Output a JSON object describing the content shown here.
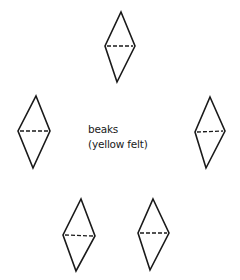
{
  "diagram": {
    "label": {
      "line1": "beaks",
      "line2": "(yellow felt)"
    },
    "stroke_color": "#1a1a1a",
    "background": "#ffffff",
    "shapes": [
      {
        "name": "beak-top",
        "top": [
          121,
          12
        ],
        "left": [
          105,
          46
        ],
        "right": [
          135,
          46
        ],
        "bottom": [
          117,
          82
        ]
      },
      {
        "name": "beak-left",
        "top": [
          36,
          96
        ],
        "left": [
          18,
          131
        ],
        "right": [
          50,
          131
        ],
        "bottom": [
          33,
          168
        ]
      },
      {
        "name": "beak-right",
        "top": [
          210,
          97
        ],
        "left": [
          195,
          132
        ],
        "right": [
          225,
          131
        ],
        "bottom": [
          206,
          168
        ]
      },
      {
        "name": "beak-bottom-left",
        "top": [
          81,
          199
        ],
        "left": [
          63,
          235
        ],
        "right": [
          95,
          236
        ],
        "bottom": [
          76,
          271
        ]
      },
      {
        "name": "beak-bottom-right",
        "top": [
          153,
          199
        ],
        "left": [
          138,
          233
        ],
        "right": [
          169,
          233
        ],
        "bottom": [
          150,
          270
        ]
      }
    ],
    "fold_line_style": "dashed"
  }
}
